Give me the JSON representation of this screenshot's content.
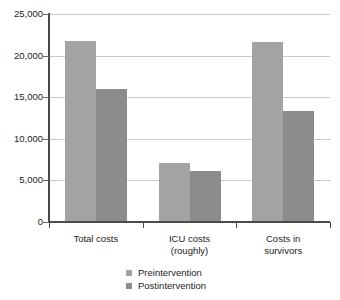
{
  "chart_data": {
    "type": "bar",
    "title": "",
    "subtitle": "",
    "xlabel": "",
    "ylabel": "",
    "categories": [
      "Total costs",
      "ICU costs (roughly)",
      "Costs in survivors"
    ],
    "category_lines": [
      [
        "Total costs",
        ""
      ],
      [
        "ICU costs",
        "(roughly)"
      ],
      [
        "Costs in",
        "survivors"
      ]
    ],
    "series": [
      {
        "name": "Preintervention",
        "values": [
          21700,
          7150,
          21600
        ],
        "color": "#a3a3a3"
      },
      {
        "name": "Postintervention",
        "values": [
          15950,
          6100,
          13350
        ],
        "color": "#8c8c8c"
      }
    ],
    "ylim": [
      0,
      25000
    ],
    "yticks": [
      0,
      5000,
      10000,
      15000,
      20000,
      25000
    ],
    "ytick_labels": [
      "0",
      "5,000",
      "10,000",
      "15,000",
      "20,000",
      "25,000"
    ],
    "grid": true,
    "grid_axis": "y",
    "legend_position": "bottom-center"
  },
  "legend": {
    "items": [
      {
        "label": "Preintervention",
        "swatch": "pre"
      },
      {
        "label": "Postintervention",
        "swatch": "post"
      }
    ]
  }
}
